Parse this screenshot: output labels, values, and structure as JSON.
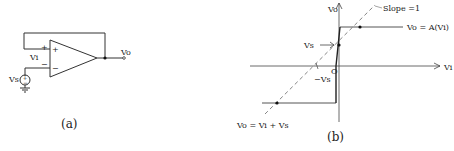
{
  "figure_a": {
    "caption": "(a)",
    "labels": {
      "vo": "Vo",
      "vi": "Vi",
      "vs": "Vs",
      "plus": "+",
      "minus": "−",
      "src_plus": "+",
      "src_minus": "−"
    }
  },
  "figure_b": {
    "caption": "(b)",
    "labels": {
      "y_axis": "Vo",
      "x_axis": "Vi",
      "slope": "Slope =1",
      "upper_curve": "Vo = A(Vi)",
      "lower_curve": "Vo = Vi + Vs",
      "vs": "Vs",
      "neg_vs": "−Vs",
      "origin": "O"
    }
  }
}
